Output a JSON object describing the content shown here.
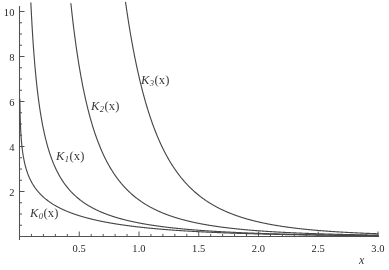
{
  "figure": {
    "background_color": "#fdfdfd",
    "curve_color": "#4a4a4a",
    "axis_color": "#555555",
    "text_color": "#2a2a2a"
  },
  "axis_label_x": "x",
  "ticks": {
    "x_labels": [
      "0.5",
      "1.0",
      "1.5",
      "2.0",
      "2.5",
      "3.0"
    ],
    "x_values": [
      0.5,
      1.0,
      1.5,
      2.0,
      2.5,
      3.0
    ],
    "y_labels": [
      "2",
      "4",
      "6",
      "8",
      "10"
    ],
    "y_values": [
      2,
      4,
      6,
      8,
      10
    ]
  },
  "curve_labels": [
    {
      "base": "K",
      "sub": "0",
      "arg": "(x)",
      "x_px": 30,
      "y_px": 206
    },
    {
      "base": "K",
      "sub": "1",
      "arg": "(x)",
      "x_px": 56,
      "y_px": 149
    },
    {
      "base": "K",
      "sub": "2",
      "arg": "(x)",
      "x_px": 91,
      "y_px": 99
    },
    {
      "base": "K",
      "sub": "3",
      "arg": "(x)",
      "x_px": 141,
      "y_px": 73
    }
  ],
  "chart_data": {
    "type": "line",
    "title": "",
    "xlabel": "x",
    "ylabel": "",
    "xlim": [
      0.0,
      3.0
    ],
    "ylim": [
      0.0,
      10.5
    ],
    "grid": false,
    "legend": "inline-curve-labels",
    "xticks": [
      0.5,
      1.0,
      1.5,
      2.0,
      2.5,
      3.0
    ],
    "yticks": [
      2,
      4,
      6,
      8,
      10
    ],
    "x_minor_tick_step": 0.1,
    "y_minor_tick_step": 0.5,
    "x": [
      0.05,
      0.1,
      0.15,
      0.2,
      0.25,
      0.3,
      0.4,
      0.5,
      0.6,
      0.7,
      0.8,
      0.9,
      1.0,
      1.2,
      1.4,
      1.6,
      1.8,
      2.0,
      2.2,
      2.4,
      2.6,
      2.8,
      3.0
    ],
    "series": [
      {
        "name": "K_0(x)",
        "label": "K₀(x)",
        "values": [
          3.114,
          2.427,
          2.03,
          1.753,
          1.542,
          1.372,
          1.115,
          0.924,
          0.778,
          0.661,
          0.565,
          0.487,
          0.421,
          0.318,
          0.244,
          0.188,
          0.146,
          0.114,
          0.089,
          0.07,
          0.055,
          0.043,
          0.035
        ]
      },
      {
        "name": "K_1(x)",
        "label": "K₁(x)",
        "values": [
          19.91,
          9.854,
          6.477,
          4.776,
          3.747,
          3.056,
          2.184,
          1.656,
          1.303,
          1.05,
          0.862,
          0.717,
          0.602,
          0.434,
          0.32,
          0.241,
          0.183,
          0.14,
          0.108,
          0.084,
          0.065,
          0.051,
          0.04
        ]
      },
      {
        "name": "K_2(x)",
        "label": "K₂(x)",
        "values": [
          799.5,
          199.5,
          88.44,
          49.51,
          31.52,
          21.746,
          11.302,
          7.55,
          5.42,
          4.08,
          3.17,
          2.52,
          2.04,
          1.376,
          0.971,
          0.708,
          0.527,
          0.398,
          0.305,
          0.235,
          0.183,
          0.143,
          0.112
        ]
      },
      {
        "name": "K_3(x)",
        "label": "K₃(x)",
        "values": [
          63990,
          7999,
          1580,
          498.5,
          204.6,
          98.68,
          31.83,
          13.9,
          7.25,
          4.25,
          2.72,
          1.86,
          1.34,
          0.79,
          0.51,
          0.352,
          0.252,
          0.185,
          0.138,
          0.104,
          0.08,
          0.062,
          0.048
        ]
      }
    ]
  }
}
